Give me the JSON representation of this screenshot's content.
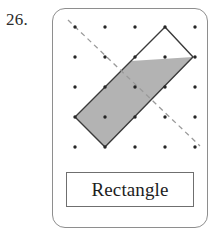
{
  "problem": {
    "number": "26."
  },
  "card": {
    "label_box": {
      "text": "Rectangle"
    }
  },
  "figure": {
    "icon_names": {
      "dot": "grid-dot-icon",
      "shape": "rectangle-shape-icon",
      "fold_line": "dashed-fold-line-icon",
      "shaded_half": "shaded-half-region-icon"
    },
    "grid": {
      "columns": 5,
      "rows": 5,
      "spacing": 30,
      "origin_x": 75,
      "origin_y": 27,
      "dot_radius": 1.7,
      "dot_color": "#262626"
    },
    "rectangle": {
      "name": "Rectangle",
      "vertices": [
        [
          165,
          27
        ],
        [
          193,
          57
        ],
        [
          105,
          147
        ],
        [
          75,
          117
        ]
      ],
      "stroke_color": "#3a3a3a",
      "stroke_width": 1.4,
      "fill_color": "#ffffff"
    },
    "shaded_region": {
      "vertices": [
        [
          131,
          61
        ],
        [
          193,
          57
        ],
        [
          105,
          147
        ],
        [
          75,
          117
        ]
      ],
      "fill_color": "#b3b3b3",
      "description": "lower-left half of the rectangle below the dashed line"
    },
    "dashed_line": {
      "from": [
        68,
        20
      ],
      "to": [
        200,
        146
      ],
      "stroke_color": "#9a9a9a",
      "stroke_width": 1.3,
      "dash_pattern": "5 4"
    }
  },
  "colors": {
    "card_border": "#8e8e8e",
    "label_border": "#6f6f6f",
    "ink": "#1d1d1d",
    "shade_gray": "#b3b3b3",
    "page_background": "#ffffff"
  }
}
